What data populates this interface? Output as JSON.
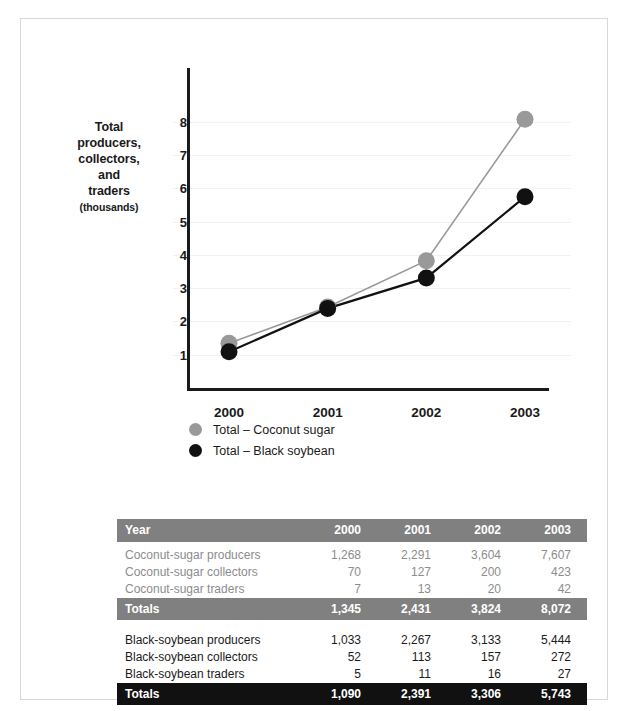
{
  "chart_data": {
    "type": "line",
    "title": "",
    "xlabel": "",
    "ylabel": "Total producers, collectors, and traders (thousands)",
    "ylabel_lines": [
      "Total",
      "producers,",
      "collectors,",
      "and",
      "traders"
    ],
    "ylabel_units": "(thousands)",
    "categories": [
      "2000",
      "2001",
      "2002",
      "2003"
    ],
    "x": [
      2000,
      2001,
      2002,
      2003
    ],
    "ylim": [
      0,
      8.6
    ],
    "yticks": [
      1,
      2,
      3,
      4,
      5,
      6,
      7,
      8
    ],
    "ytick_labels": [
      "1",
      "2",
      "3",
      "4",
      "5",
      "6",
      "7",
      "8"
    ],
    "grid": true,
    "grid_axis": "y",
    "legend_position": "bottom",
    "markers": "circle",
    "series": [
      {
        "name": "Total – Coconut sugar",
        "color": "#999999",
        "values": [
          1.345,
          2.431,
          3.824,
          8.072
        ]
      },
      {
        "name": "Total – Black soybean",
        "color": "#111111",
        "values": [
          1.09,
          2.391,
          3.306,
          5.743
        ]
      }
    ]
  },
  "legend": {
    "items": [
      {
        "label": "Total – Coconut sugar",
        "color": "#999999"
      },
      {
        "label": "Total – Black soybean",
        "color": "#111111"
      }
    ]
  },
  "table": {
    "header": {
      "label": "Year",
      "columns": [
        "2000",
        "2001",
        "2002",
        "2003"
      ]
    },
    "groups": [
      {
        "style": "coconut",
        "rows": [
          {
            "label": "Coconut-sugar producers",
            "values": [
              "1,268",
              "2,291",
              "3,604",
              "7,607"
            ]
          },
          {
            "label": "Coconut-sugar collectors",
            "values": [
              "70",
              "127",
              "200",
              "423"
            ]
          },
          {
            "label": "Coconut-sugar traders",
            "values": [
              "7",
              "13",
              "20",
              "42"
            ]
          }
        ],
        "total": {
          "label": "Totals",
          "values": [
            "1,345",
            "2,431",
            "3,824",
            "8,072"
          ]
        }
      },
      {
        "style": "soy",
        "rows": [
          {
            "label": "Black-soybean producers",
            "values": [
              "1,033",
              "2,267",
              "3,133",
              "5,444"
            ]
          },
          {
            "label": "Black-soybean collectors",
            "values": [
              "52",
              "113",
              "157",
              "272"
            ]
          },
          {
            "label": "Black-soybean traders",
            "values": [
              "5",
              "11",
              "16",
              "27"
            ]
          }
        ],
        "total": {
          "label": "Totals",
          "values": [
            "1,090",
            "2,391",
            "3,306",
            "5,743"
          ]
        }
      }
    ]
  },
  "colors": {
    "coconut": "#999999",
    "soybean": "#111111",
    "header_band": "#808080",
    "total_gray_band": "#808080",
    "total_black_band": "#111111",
    "grid": "#f2f2f2",
    "axis": "#1a1a1a",
    "frame_border": "#d8d8d8"
  }
}
